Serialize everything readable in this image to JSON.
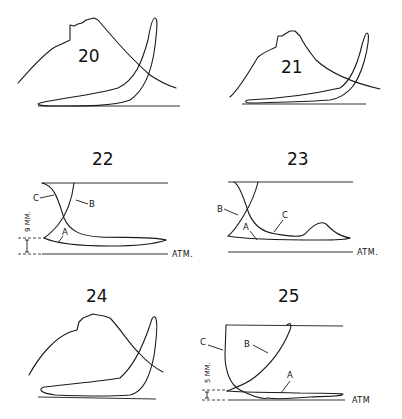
{
  "figures": [
    {
      "id": "fig-20",
      "number": "20"
    },
    {
      "id": "fig-21",
      "number": "21"
    },
    {
      "id": "fig-22",
      "number": "22",
      "labels": [
        "A",
        "B",
        "C"
      ],
      "scale": "9 MM.",
      "baseline": "ATM."
    },
    {
      "id": "fig-23",
      "number": "23",
      "labels": [
        "A",
        "B",
        "C"
      ],
      "baseline": "ATM."
    },
    {
      "id": "fig-24",
      "number": "24"
    },
    {
      "id": "fig-25",
      "number": "25",
      "labels": [
        "A",
        "B",
        "C"
      ],
      "scale": "5 MM.",
      "baseline": "ATM"
    }
  ],
  "colors": {
    "ink": "#1a1a1a",
    "background": "#ffffff"
  }
}
